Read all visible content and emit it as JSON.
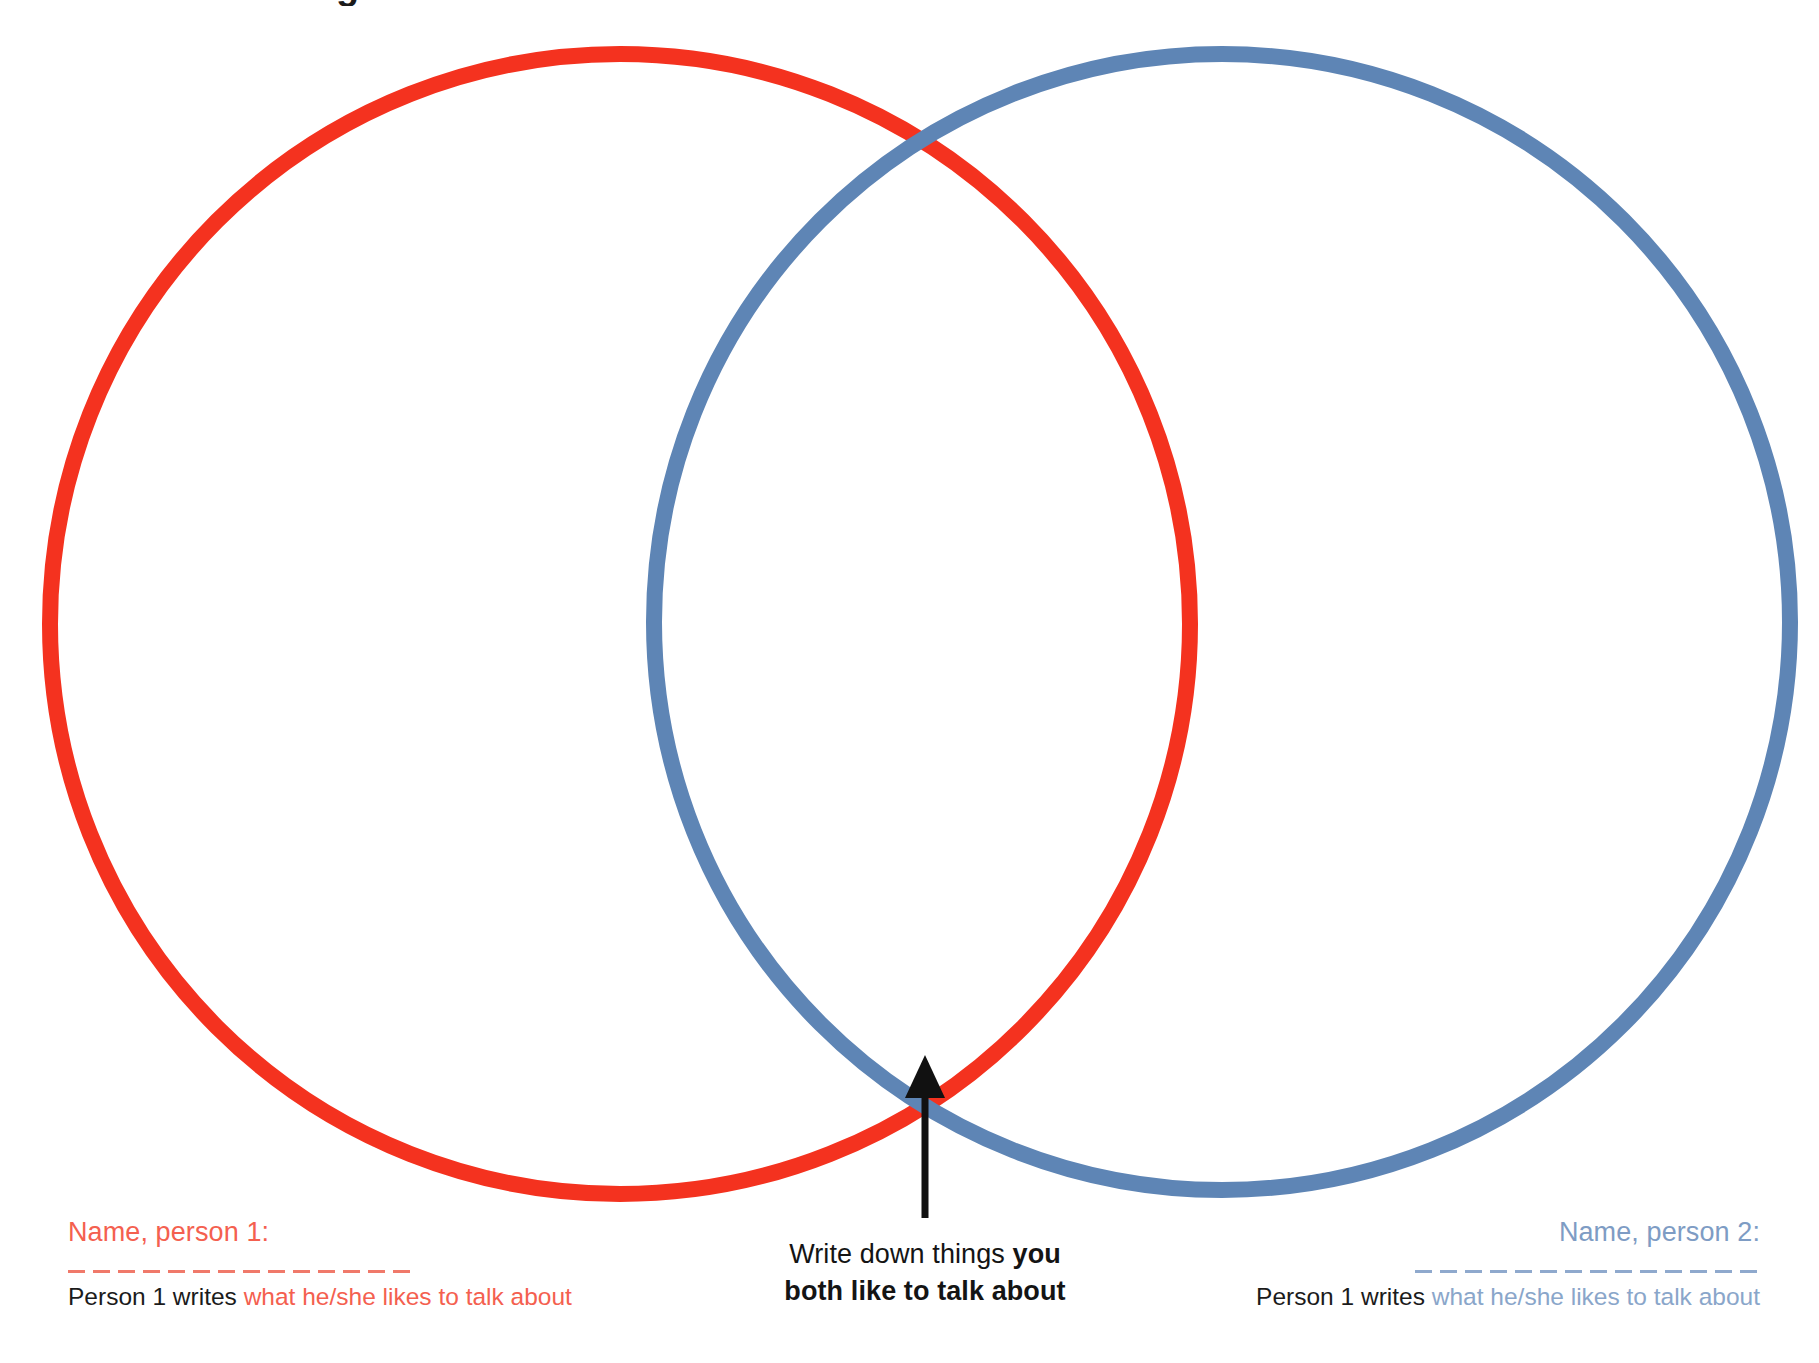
{
  "page": {
    "background_color": "#ffffff",
    "title_fragment": "Things we like to talk about"
  },
  "colors": {
    "red_circle": "#f4321f",
    "blue_circle": "#5e85b5",
    "red_text": "#f4604f",
    "blue_text": "#7e9cc4",
    "arrow": "#111111",
    "body_text": "#1b1b1b"
  },
  "venn": {
    "left_circle": {
      "name": "person-1-circle",
      "color": "#f4321f",
      "cx": 620,
      "cy": 624,
      "r": 570,
      "stroke_width": 16
    },
    "right_circle": {
      "name": "person-2-circle",
      "color": "#5e85b5",
      "cx": 1222,
      "cy": 622,
      "r": 568,
      "stroke_width": 16
    }
  },
  "arrow": {
    "label": "pointer-to-overlap",
    "x": 925,
    "y_top": 1059,
    "y_bottom": 1218,
    "color": "#111111"
  },
  "person1": {
    "name_label": "Name, person 1:",
    "name_value": "",
    "name_placeholder": "",
    "writes_prefix": "Person 1 writes ",
    "writes_hint": "what he/she likes to talk about"
  },
  "person2": {
    "name_label": "Name, person 2:",
    "name_value": "",
    "name_placeholder": "",
    "writes_prefix": "Person 1 writes ",
    "writes_hint": "what he/she likes to talk about"
  },
  "center": {
    "line1_plain": "Write down things ",
    "line1_bold": "you",
    "line2_bold": "both like to talk about"
  }
}
